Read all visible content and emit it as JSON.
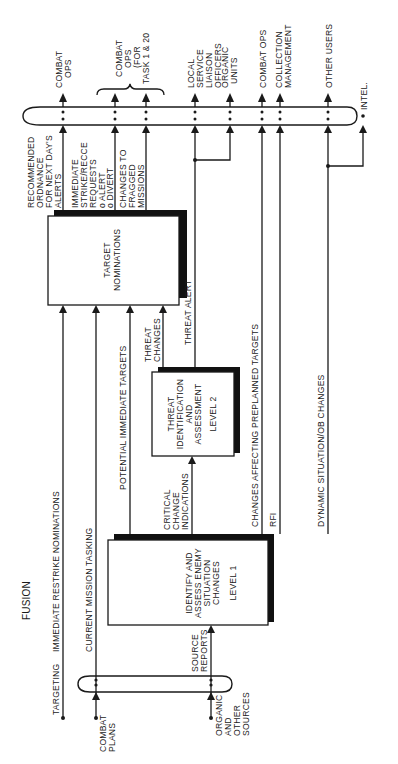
{
  "diagram": {
    "title": "FUSION",
    "orientation": "rotated 90° counter-clockwise (read bottom-to-top)",
    "processes": {
      "level1": {
        "line1": "IDENTIFY AND",
        "line2": "ASSESS ENEMY",
        "line3": "SITUATION",
        "line4": "CHANGES",
        "level": "LEVEL 1"
      },
      "level2": {
        "line1": "THREAT",
        "line2": "IDENTIFICATION",
        "line3": "AND",
        "line4": "ASSESSMENT",
        "level": "LEVEL 2"
      },
      "target_nominations": {
        "line1": "TARGET",
        "line2": "NOMINATIONS"
      }
    },
    "inputs": {
      "targeting": "TARGETING",
      "combat_plans": {
        "line1": "COMBAT",
        "line2": "PLANS"
      },
      "organic_sources": {
        "line1": "ORGANIC",
        "line2": "AND",
        "line3": "OTHER",
        "line4": "SOURCES"
      }
    },
    "flows": {
      "immediate_restrike": "IMMEDIATE RESTRIKE NOMINATIONS",
      "current_mission_tasking": "CURRENT MISSION TASKING",
      "potential_immediate_targets": "POTENTIAL IMMEDIATE TARGETS",
      "threat_changes": {
        "line1": "THREAT",
        "line2": "CHANGES"
      },
      "threat_alert": "THREAT ALERT",
      "critical_change": {
        "line1": "CRITICAL",
        "line2": "CHANGE",
        "line3": "INDICATIONS"
      },
      "changes_affecting_preplanned": "CHANGES AFFECTING PREPLANNED TARGETS",
      "rfi": "RFI",
      "dynamic_situation": "DYNAMIC SITUATION/OB CHANGES",
      "source_reports": {
        "line1": "SOURCE",
        "line2": "REPORTS"
      },
      "recommended_ordnance": {
        "line1": "RECOMMENDED",
        "line2": "ORDNANCE",
        "line3": "FOR NEXT DAY'S",
        "line4": "ALERTS"
      },
      "immediate_strike": {
        "line1": "IMMEDIATE",
        "line2": "STRIKE/RECCE",
        "line3": "REQUESTS",
        "line4": "o ALERT",
        "line5": "o DIVERT"
      },
      "changes_fragged": {
        "line1": "CHANGES TO",
        "line2": "FRAGGED",
        "line3": "MISSIONS"
      }
    },
    "outputs": {
      "combat_ops_1": {
        "line1": "COMBAT",
        "line2": "OPS"
      },
      "combat_ops_task": {
        "line1": "COMBAT",
        "line2": "OPS",
        "line3": "(FOR",
        "line4": "TASK 1 & 20"
      },
      "local_service": {
        "line1": "LOCAL",
        "line2": "SERVICE",
        "line3": "LIAISON",
        "line4": "OFFICERS"
      },
      "organic_units": {
        "line1": "ORGANIC",
        "line2": "UNITS"
      },
      "combat_ops_2": "COMBAT OPS",
      "collection_mgmt": {
        "line1": "COLLECTION",
        "line2": "MANAGEMENT"
      },
      "other_users": "OTHER USERS",
      "intel": "INTEL."
    },
    "colors": {
      "ink": "#1a1a1a",
      "paper": "#ffffff"
    }
  }
}
